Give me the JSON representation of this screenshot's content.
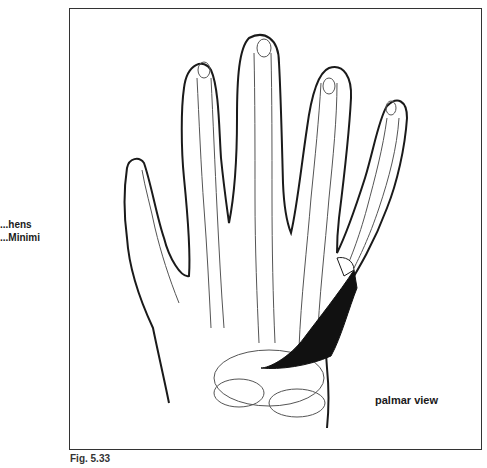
{
  "labels": {
    "muscle_name_line1": "...hens",
    "muscle_name_line2": "...Minimi",
    "view": "palmar view",
    "figure": "Fig. 5.33"
  },
  "colors": {
    "outline": "#1a1a1a",
    "bone": "#555555",
    "muscle": "#111111",
    "frame": "#333333"
  }
}
